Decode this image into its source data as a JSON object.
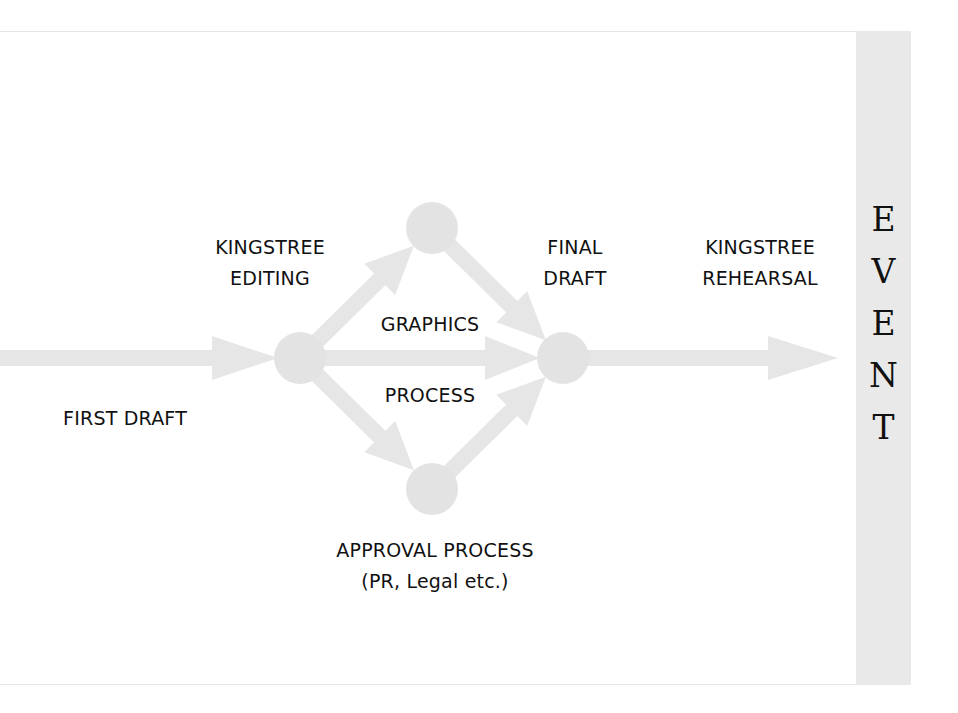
{
  "diagram": {
    "stages": {
      "first_draft": "FIRST DRAFT",
      "editing": "KINGSTREE\nEDITING",
      "graphics_process": {
        "line1": "GRAPHICS",
        "line2": "PROCESS"
      },
      "approval": "APPROVAL PROCESS\n(PR, Legal etc.)",
      "final_draft": "FINAL\nDRAFT",
      "rehearsal": "KINGSTREE\nREHEARSAL"
    },
    "event": {
      "letters": [
        "E",
        "V",
        "E",
        "N",
        "T"
      ]
    },
    "colors": {
      "arrow": "#e6e6e6",
      "node": "#e3e3e3",
      "event_bar": "#e9e9e9",
      "text": "#111111"
    }
  }
}
